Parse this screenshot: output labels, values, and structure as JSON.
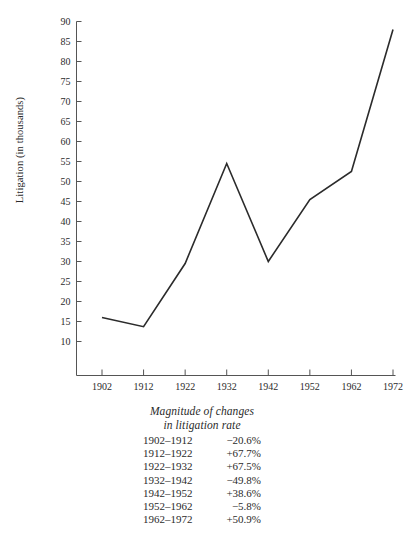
{
  "chart_data": {
    "type": "line",
    "title": "",
    "xlabel": "",
    "ylabel": "Litigation (in thousands)",
    "x": [
      1902,
      1912,
      1922,
      1932,
      1942,
      1952,
      1962,
      1972
    ],
    "categories": [
      "1902",
      "1912",
      "1922",
      "1932",
      "1942",
      "1952",
      "1962",
      "1972"
    ],
    "values": [
      16.0,
      13.7,
      29.5,
      54.5,
      30.0,
      45.5,
      52.5,
      88.0
    ],
    "series": [
      {
        "name": "Litigation",
        "values": [
          16.0,
          13.7,
          29.5,
          54.5,
          30.0,
          45.5,
          52.5,
          88.0
        ]
      }
    ],
    "xlim": [
      1897,
      1977
    ],
    "ylim": [
      7,
      92
    ],
    "yticks": [
      10,
      15,
      20,
      25,
      30,
      35,
      40,
      45,
      50,
      55,
      60,
      65,
      70,
      75,
      80,
      85,
      90
    ],
    "ytick_labels": [
      "10",
      "15",
      "20",
      "25",
      "30",
      "35",
      "40",
      "45",
      "50",
      "55",
      "60",
      "65",
      "70",
      "75",
      "80",
      "85",
      "90"
    ],
    "xticks": [
      1902,
      1912,
      1922,
      1932,
      1942,
      1952,
      1962,
      1972
    ],
    "xtick_labels": [
      "1902",
      "1912",
      "1922",
      "1932",
      "1942",
      "1952",
      "1962",
      "1972"
    ],
    "grid": false,
    "legend": false,
    "line_color": "#2b2b2b",
    "axis_color": "#555555",
    "background_color": "#ffffff"
  },
  "axes": {
    "y_title": "Litigation (in thousands)"
  },
  "caption": {
    "title_line_1": "Magnitude of changes",
    "title_line_2": "in litigation rate",
    "rows": [
      {
        "period": "1902–1912",
        "change": "−20.6%"
      },
      {
        "period": "1912–1922",
        "change": "+67.7%"
      },
      {
        "period": "1922–1932",
        "change": "+67.5%"
      },
      {
        "period": "1932–1942",
        "change": "−49.8%"
      },
      {
        "period": "1942–1952",
        "change": "+38.6%"
      },
      {
        "period": "1952–1962",
        "change": "−5.8%"
      },
      {
        "period": "1962–1972",
        "change": "+50.9%"
      }
    ]
  }
}
